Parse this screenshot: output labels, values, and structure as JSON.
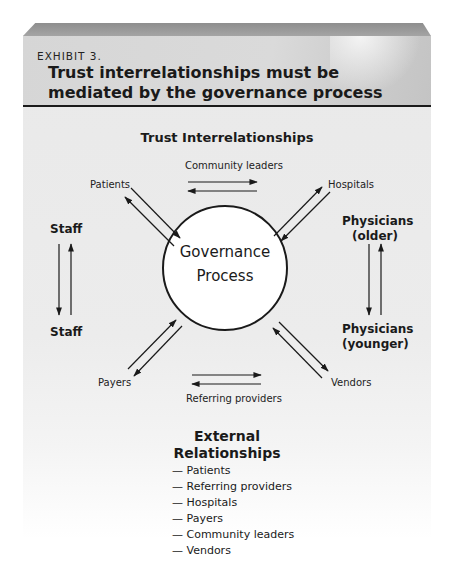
{
  "exhibit": {
    "label": "EXHIBIT 3.",
    "title_line1": "Trust interrelationships must be",
    "title_line2": "mediated by the governance process"
  },
  "diagram": {
    "section_title": "Trust Interrelationships",
    "center": {
      "line1": "Governance",
      "line2": "Process"
    },
    "nodes": {
      "patients": "Patients",
      "hospitals": "Hospitals",
      "payers": "Payers",
      "vendors": "Vendors",
      "community_leaders": "Community leaders",
      "referring_providers": "Referring providers",
      "staff_top": "Staff",
      "staff_bottom": "Staff",
      "physicians_older_1": "Physicians",
      "physicians_older_2": "(older)",
      "physicians_younger_1": "Physicians",
      "physicians_younger_2": "(younger)"
    }
  },
  "external": {
    "title_line1": "External",
    "title_line2": "Relationships",
    "items": [
      "— Patients",
      "— Referring providers",
      "— Hospitals",
      "— Payers",
      "— Community leaders",
      "— Vendors"
    ]
  },
  "colors": {
    "panel": "#ececec",
    "header": "#d6d6d6",
    "rule": "#1a1a1a",
    "ink": "#1a1a1a"
  }
}
